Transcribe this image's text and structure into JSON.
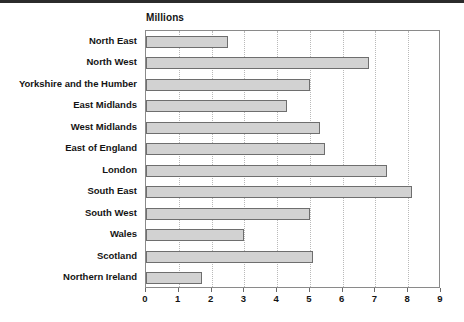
{
  "chart_data": {
    "type": "bar",
    "orientation": "horizontal",
    "title": "Millions",
    "xlabel": "",
    "ylabel": "",
    "xlim": [
      0,
      9
    ],
    "xticks": [
      0,
      1,
      2,
      3,
      4,
      5,
      6,
      7,
      8,
      9
    ],
    "grid": true,
    "legend": false,
    "bar_color": "#d2d2d2",
    "bar_border_color": "#6e6e6e",
    "categories": [
      "North East",
      "North West",
      "Yorkshire and the Humber",
      "East Midlands",
      "West Midlands",
      "East of England",
      "London",
      "South East",
      "South West",
      "Wales",
      "Scotland",
      "Northern Ireland"
    ],
    "values": [
      2.5,
      6.8,
      5.0,
      4.3,
      5.3,
      5.45,
      7.35,
      8.1,
      5.0,
      3.0,
      5.1,
      1.7
    ]
  }
}
